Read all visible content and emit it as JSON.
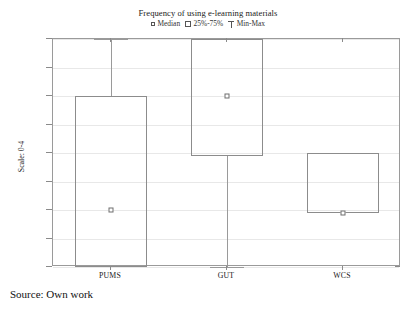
{
  "chart_data": {
    "type": "box",
    "title": "Frequency of using e-learning materials",
    "xlabel": "",
    "ylabel": "Scale: 0-4",
    "ylim": [
      0,
      4
    ],
    "yticks": [
      "0,0",
      "0,5",
      "1,0",
      "1,5",
      "2,0",
      "2,5",
      "3,0",
      "3,5",
      "4,0"
    ],
    "ytick_values": [
      0,
      0.5,
      1,
      1.5,
      2,
      2.5,
      3,
      3.5,
      4
    ],
    "grid": true,
    "legend_position": "top-center",
    "categories": [
      "PUMS",
      "GUT",
      "WCS"
    ],
    "series": [
      {
        "name": "PUMS",
        "min": 0.0,
        "q1": 0.0,
        "median": 1.0,
        "q3": 3.0,
        "max": 4.0
      },
      {
        "name": "GUT",
        "min": 0.0,
        "q1": 1.95,
        "median": 3.0,
        "q3": 4.0,
        "max": 4.0
      },
      {
        "name": "WCS",
        "min": 0.95,
        "q1": 0.95,
        "median": 0.95,
        "q3": 2.0,
        "max": 2.0
      }
    ]
  },
  "legend": {
    "median_label": "Median",
    "box_label": "25%-75%",
    "minmax_label": "Min-Max"
  },
  "caption": {
    "source": "Source: Own work"
  }
}
